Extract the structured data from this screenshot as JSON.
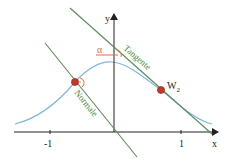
{
  "diagram": {
    "title": "",
    "axes": {
      "x_label": "x",
      "y_label": "y",
      "x_ticks": [
        {
          "value": -1,
          "label": "-1"
        },
        {
          "value": 1,
          "label": "1"
        }
      ]
    },
    "curve": {
      "name": "bell-curve",
      "color": "#7fb6d8"
    },
    "lines": {
      "tangent": {
        "label": "Tangente",
        "color": "#3f7a3f"
      },
      "normal": {
        "label": "Normale",
        "color": "#3f7a3f"
      }
    },
    "points": {
      "left": {
        "label": ""
      },
      "w2": {
        "label": "W",
        "subscript": "2"
      }
    },
    "angle": {
      "label": "α",
      "color": "#e0703a"
    },
    "colors": {
      "axis": "#222222",
      "point_fill": "#c0392b",
      "point_stroke": "#8e2318",
      "label_green": "#4a8a3a",
      "label_dark": "#222222"
    }
  }
}
